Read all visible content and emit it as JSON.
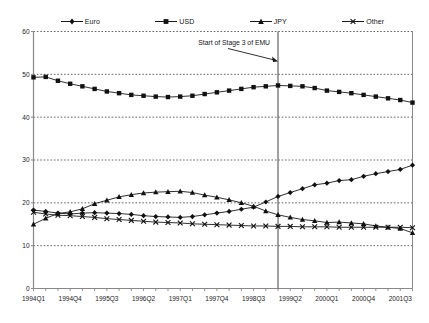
{
  "chart_data": {
    "type": "line",
    "title": "",
    "subtitle": "",
    "xlabel": "",
    "ylabel": "",
    "ylim": [
      0,
      60
    ],
    "ytick_values": [
      0,
      10,
      20,
      30,
      40,
      50,
      60
    ],
    "ytick_labels": [
      "0",
      "10",
      "20",
      "30",
      "40",
      "50",
      "60"
    ],
    "grid": "horizontal-dotted",
    "legend_position": "top",
    "x": [
      "1994Q1",
      "1994Q2",
      "1994Q3",
      "1994Q4",
      "1995Q1",
      "1995Q2",
      "1995Q3",
      "1995Q4",
      "1996Q1",
      "1996Q2",
      "1996Q3",
      "1996Q4",
      "1997Q1",
      "1997Q2",
      "1997Q3",
      "1997Q4",
      "1998Q1",
      "1998Q2",
      "1998Q3",
      "1998Q4",
      "1999Q1",
      "1999Q2",
      "1999Q3",
      "1999Q4",
      "2000Q1",
      "2000Q2",
      "2000Q3",
      "2000Q4",
      "2001Q1",
      "2001Q2",
      "2001Q3",
      "2001Q4"
    ],
    "xtick_labels": [
      "1994Q1",
      "1994Q4",
      "1995Q3",
      "1996Q2",
      "1997Q1",
      "1997Q4",
      "1998Q3",
      "1999Q2",
      "2000Q1",
      "2000Q4",
      "2001Q3"
    ],
    "xtick_indices": [
      0,
      3,
      6,
      9,
      12,
      15,
      18,
      21,
      24,
      27,
      30
    ],
    "series": [
      {
        "name": "Euro",
        "marker": "diamond",
        "values": [
          18.3,
          18.0,
          17.6,
          17.4,
          17.6,
          17.7,
          17.6,
          17.5,
          17.3,
          17.0,
          16.8,
          16.7,
          16.6,
          16.8,
          17.2,
          17.6,
          18.0,
          18.5,
          19.0,
          20.2,
          21.5,
          22.4,
          23.3,
          24.2,
          24.6,
          25.2,
          25.4,
          26.2,
          26.8,
          27.3,
          27.8,
          28.8
        ]
      },
      {
        "name": "USD",
        "marker": "square",
        "values": [
          49.3,
          49.4,
          48.5,
          47.8,
          47.2,
          46.6,
          46.0,
          45.6,
          45.2,
          45.0,
          44.8,
          44.7,
          44.8,
          45.0,
          45.4,
          45.8,
          46.2,
          46.6,
          47.0,
          47.2,
          47.4,
          47.3,
          47.2,
          46.8,
          46.2,
          45.9,
          45.6,
          45.2,
          44.8,
          44.4,
          44.0,
          43.4
        ]
      },
      {
        "name": "JPY",
        "marker": "triangle",
        "values": [
          15.0,
          16.4,
          17.5,
          17.9,
          18.6,
          19.8,
          20.6,
          21.4,
          21.9,
          22.3,
          22.5,
          22.6,
          22.7,
          22.4,
          21.8,
          21.3,
          20.7,
          20.0,
          19.2,
          18.1,
          17.2,
          16.6,
          16.1,
          15.8,
          15.4,
          15.5,
          15.3,
          15.1,
          14.6,
          14.3,
          14.0,
          13.0
        ]
      },
      {
        "name": "Other",
        "marker": "cross",
        "values": [
          17.8,
          17.4,
          17.1,
          17.0,
          16.8,
          16.6,
          16.3,
          16.1,
          15.9,
          15.7,
          15.5,
          15.4,
          15.3,
          15.1,
          15.0,
          14.9,
          14.8,
          14.7,
          14.6,
          14.6,
          14.5,
          14.5,
          14.4,
          14.4,
          14.4,
          14.3,
          14.3,
          14.3,
          14.3,
          14.3,
          14.3,
          14.2
        ]
      }
    ],
    "annotations": [
      {
        "text": "Start of Stage 3 of EMU",
        "x_label": "1999Q1",
        "x_index": 20,
        "type": "vertical-line-with-arrow"
      }
    ]
  },
  "legend": {
    "entries": [
      {
        "label": "Euro",
        "marker": "diamond"
      },
      {
        "label": "USD",
        "marker": "square"
      },
      {
        "label": "JPY",
        "marker": "triangle"
      },
      {
        "label": "Other",
        "marker": "cross"
      }
    ]
  },
  "colors": {
    "line": "#1a1a1a",
    "marker": "#111111",
    "grid": "#555555",
    "axis": "#888888",
    "annotation": "#555555",
    "background": "#ffffff"
  }
}
